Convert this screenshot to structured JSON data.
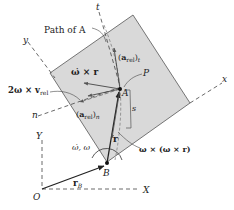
{
  "diagram": {
    "plate_color": "#d9d9d9",
    "line_color": "#222222",
    "labels": {
      "path_of_A": "Path of A",
      "t_axis": "t",
      "y_axis": "y",
      "x_axis": "x",
      "n_axis": "n",
      "Y_axis": "Y",
      "X_axis": "X",
      "origin": "O",
      "point_B": "B",
      "point_A": "A",
      "point_P": "P",
      "arc_s": "s",
      "a_rel_t": "(a_rel)_t",
      "a_rel_n": "(a_rel)_n",
      "omega_dot_cross_r": "ω̇ × r",
      "coriolis": "2ω × v_rel",
      "centripetal": "ω × (ω × r)",
      "omega": "ω̇, ω",
      "r": "r",
      "r_B": "r_B"
    }
  }
}
